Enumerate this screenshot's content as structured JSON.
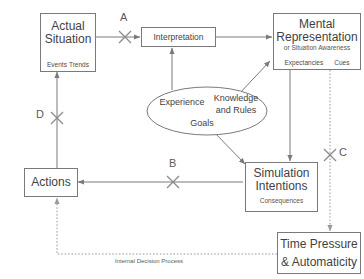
{
  "diagram": {
    "background_color": "#ffffff",
    "line_color": "#7a7a7a",
    "text_color": "#3f3f3f"
  },
  "nodes": {
    "actual_situation": {
      "title_line1": "Actual",
      "title_line2": "Situation",
      "slot1": "Events",
      "slot2": "Trends"
    },
    "interpretation": {
      "label": "Interpretation"
    },
    "mental_representation": {
      "title_line1": "Mental",
      "title_line2": "Representation",
      "subtitle": "or Situation Awareness",
      "slot1": "Expectancies",
      "slot2": "Cues"
    },
    "knowledge_ellipse": {
      "item1": "Experience",
      "item2_line1": "Knowledge",
      "item2_line2": "and Rules",
      "item3": "Goals"
    },
    "simulation_intentions": {
      "title_line1": "Simulation",
      "title_line2": "Intentions",
      "subtitle": "Consequences"
    },
    "actions": {
      "label": "Actions"
    },
    "time_pressure": {
      "title_line1": "Time Pressure",
      "title_line2": "& Automaticity"
    }
  },
  "link_markers": {
    "a": "A",
    "b": "B",
    "c": "C",
    "d": "D"
  },
  "captions": {
    "internal_decision_process": "Internal Decision Process"
  }
}
